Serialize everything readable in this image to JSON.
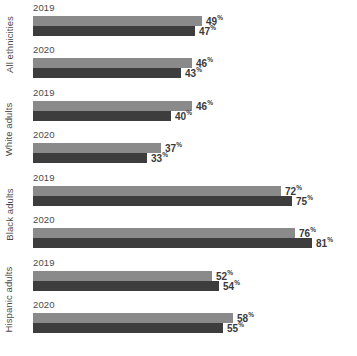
{
  "chart_data": {
    "type": "bar",
    "orientation": "horizontal",
    "title": "",
    "subtitle": "",
    "xlabel": "",
    "ylabel": "",
    "xlim": [
      0,
      100
    ],
    "grid": false,
    "legend_position": "none",
    "value_suffix": "%",
    "colors": {
      "series_2019_like_light": "#8a8a8a",
      "series_dark": "#3d3d3d",
      "text": "#4a4a4a",
      "value_text": "#3a3a3a",
      "background": "#ffffff"
    },
    "categories": [
      "All ethnicities",
      "White adults",
      "Black adults",
      "Hispanic adults"
    ],
    "subcategories": [
      "2019",
      "2020"
    ],
    "series": [
      {
        "name": "light",
        "color": "#8a8a8a"
      },
      {
        "name": "dark",
        "color": "#3d3d3d"
      }
    ],
    "groups": [
      {
        "label": "All ethnicities",
        "years": [
          {
            "year": "2019",
            "bars": [
              {
                "series": "light",
                "value": 49,
                "label": "49",
                "suffix": "%"
              },
              {
                "series": "dark",
                "value": 47,
                "label": "47",
                "suffix": "%"
              }
            ]
          },
          {
            "year": "2020",
            "bars": [
              {
                "series": "light",
                "value": 46,
                "label": "46",
                "suffix": "%"
              },
              {
                "series": "dark",
                "value": 43,
                "label": "43",
                "suffix": "%"
              }
            ]
          }
        ]
      },
      {
        "label": "White adults",
        "years": [
          {
            "year": "2019",
            "bars": [
              {
                "series": "light",
                "value": 46,
                "label": "46",
                "suffix": "%"
              },
              {
                "series": "dark",
                "value": 40,
                "label": "40",
                "suffix": "%"
              }
            ]
          },
          {
            "year": "2020",
            "bars": [
              {
                "series": "light",
                "value": 37,
                "label": "37",
                "suffix": "%"
              },
              {
                "series": "dark",
                "value": 33,
                "label": "33",
                "suffix": "%"
              }
            ]
          }
        ]
      },
      {
        "label": "Black adults",
        "years": [
          {
            "year": "2019",
            "bars": [
              {
                "series": "light",
                "value": 72,
                "label": "72",
                "suffix": "%"
              },
              {
                "series": "dark",
                "value": 75,
                "label": "75",
                "suffix": "%"
              }
            ]
          },
          {
            "year": "2020",
            "bars": [
              {
                "series": "light",
                "value": 76,
                "label": "76",
                "suffix": "%"
              },
              {
                "series": "dark",
                "value": 81,
                "label": "81",
                "suffix": "%"
              }
            ]
          }
        ]
      },
      {
        "label": "Hispanic adults",
        "years": [
          {
            "year": "2019",
            "bars": [
              {
                "series": "light",
                "value": 52,
                "label": "52",
                "suffix": "%"
              },
              {
                "series": "dark",
                "value": 54,
                "label": "54",
                "suffix": "%"
              }
            ]
          },
          {
            "year": "2020",
            "bars": [
              {
                "series": "light",
                "value": 58,
                "label": "58",
                "suffix": "%"
              },
              {
                "series": "dark",
                "value": 55,
                "label": "55",
                "suffix": "%"
              }
            ]
          }
        ]
      }
    ]
  }
}
